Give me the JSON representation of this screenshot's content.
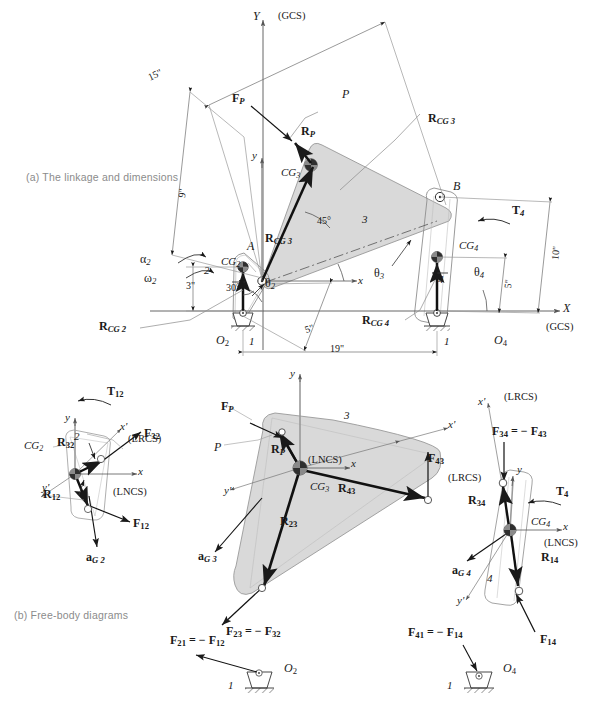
{
  "figure": {
    "caption_a": "(a)  The linkage and dimensions",
    "caption_b": "(b)  Free-body diagrams"
  },
  "part_a": {
    "axes": {
      "Y": "Y",
      "X": "X",
      "x_local": "x",
      "y_local": "y",
      "gcs_top": "(GCS)",
      "gcs_bottom": "(GCS)"
    },
    "dimensions": [
      {
        "name": "coupler-length",
        "value": "15\""
      },
      {
        "name": "crank-offset",
        "value": "9\""
      },
      {
        "name": "rocker-length",
        "value": "10\""
      },
      {
        "name": "cg4-distance",
        "value": "5\""
      },
      {
        "name": "cg2-vertical",
        "value": "3\""
      },
      {
        "name": "crank-length",
        "value": "5\""
      },
      {
        "name": "ground-length",
        "value": "19\""
      },
      {
        "name": "cg2-angle",
        "value": "30°"
      },
      {
        "name": "cg3-angle",
        "value": "45°"
      }
    ],
    "links": {
      "link1_left": "1",
      "link1_right": "1",
      "link2": "2",
      "link3": "3",
      "link4": "4"
    },
    "joints": {
      "O2": "O",
      "O2_sub": "2",
      "O4": "O",
      "O4_sub": "4",
      "A": "A",
      "B": "B",
      "P": "P"
    },
    "cg": {
      "cg2": "CG",
      "cg2_sub": "2",
      "cg3": "CG",
      "cg3_sub": "3",
      "cg4": "CG",
      "cg4_sub": "4"
    },
    "vectors": {
      "FP": "F",
      "FP_sub": "P",
      "RP": "R",
      "RP_sub": "P",
      "RCG2": "R",
      "RCG2_sub": "CG 2",
      "RCG3": "R",
      "RCG3_sub": "CG 3",
      "RCG4": "R",
      "RCG4_sub": "CG 4",
      "T4": "T",
      "T4_sub": "4"
    },
    "angles": {
      "theta2": "θ",
      "theta2_sub": "2",
      "theta3": "θ",
      "theta3_sub": "3",
      "theta4": "θ",
      "theta4_sub": "4",
      "alpha2": "α",
      "alpha2_sub": "2",
      "omega2": "ω",
      "omega2_sub": "2"
    }
  },
  "part_b": {
    "link2_fbd": {
      "link_number": "2",
      "T12": "T",
      "T12_sub": "12",
      "R32": "R",
      "R32_sub": "32",
      "R12": "R",
      "R12_sub": "12",
      "F32": "F",
      "F32_sub": "32",
      "F12": "F",
      "F12_sub": "12",
      "aG2": "a",
      "aG2_sub": "G 2",
      "CG2": "CG",
      "CG2_sub": "2",
      "x": "x",
      "y": "y",
      "xp": "x'",
      "yp": "y'",
      "lrcs": "(LRCS)",
      "lncs": "(LNCS)"
    },
    "link3_fbd": {
      "link_number": "3",
      "FP": "F",
      "FP_sub": "P",
      "P": "P",
      "RP": "R",
      "RP_sub": "P",
      "R23": "R",
      "R23_sub": "23",
      "R43": "R",
      "R43_sub": "43",
      "F43": "F",
      "F43_sub": "43",
      "F23_eq": "F23 = − F32",
      "F23": "F",
      "F23_sub": "23",
      "F23_neg": " = − ",
      "F23_rhs": "F",
      "F23_rhs_sub": "32",
      "aG3": "a",
      "aG3_sub": "G 3",
      "CG3": "CG",
      "CG3_sub": "3",
      "x": "x",
      "y": "y",
      "xp": "x'",
      "yp": "y'",
      "lncs": "(LNCS)",
      "lrcs": "(LRCS)"
    },
    "link4_fbd": {
      "link_number": "4",
      "T4": "T",
      "T4_sub": "4",
      "R34": "R",
      "R34_sub": "34",
      "R14": "R",
      "R14_sub": "14",
      "F34": "F",
      "F34_sub": "34",
      "F34_neg": " = − ",
      "F34_rhs": "F",
      "F34_rhs_sub": "43",
      "F14": "F",
      "F14_sub": "14",
      "aG4": "a",
      "aG4_sub": "G 4",
      "CG4": "CG",
      "CG4_sub": "4",
      "x": "x",
      "y": "y",
      "xp": "x'",
      "yp": "y'",
      "lrcs": "(LRCS)",
      "lncs": "(LNCS)"
    },
    "ground_left": {
      "link_number": "1",
      "O2": "O",
      "O2_sub": "2",
      "F21": "F",
      "F21_sub": "21",
      "F21_neg": " = − ",
      "F21_rhs": "F",
      "F21_rhs_sub": "12"
    },
    "ground_right": {
      "link_number": "1",
      "O4": "O",
      "O4_sub": "4",
      "F41": "F",
      "F41_sub": "41",
      "F41_neg": " = − ",
      "F41_rhs": "F",
      "F41_rhs_sub": "14"
    }
  },
  "colors": {
    "line": "#1a1a1a",
    "thin": "#6e6e6e",
    "shade": "#d9d9d9",
    "shade_edge": "#9a9a9a",
    "caption": "#8b8b8b"
  }
}
